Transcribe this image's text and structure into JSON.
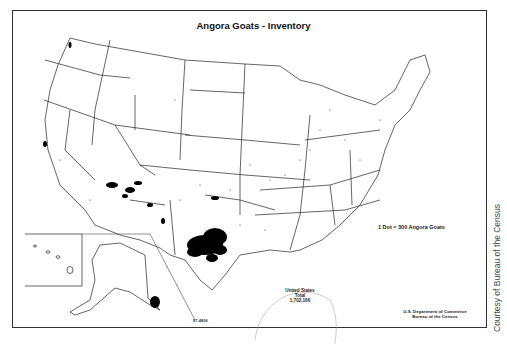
{
  "title": "Angora Goats - Inventory",
  "legend": {
    "dot_value": "1 Dot = 300 Angora Goats"
  },
  "total": {
    "line1": "United States",
    "line2": "Total",
    "value": "1,702,166"
  },
  "map_code": "87-4806",
  "credit": {
    "line1": "U.S. Department of Commerce",
    "line2": "Bureau of the Census"
  },
  "courtesy": "Courtesy of Bureau of the Census",
  "insets": [
    "Alaska",
    "Hawaii"
  ],
  "colors": {
    "border": "#333333",
    "dots": "#000000",
    "background": "#ffffff"
  },
  "concentrations": [
    {
      "region": "Texas (Edwards Plateau)",
      "density": "very high"
    },
    {
      "region": "Arizona / New Mexico",
      "density": "moderate"
    },
    {
      "region": "Oklahoma",
      "density": "low"
    },
    {
      "region": "Midwest / East",
      "density": "sparse"
    }
  ]
}
